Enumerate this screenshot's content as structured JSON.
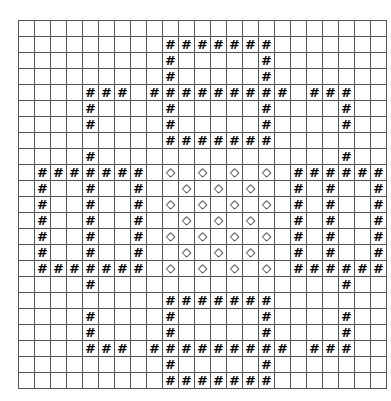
{
  "canvas": {
    "width": 391,
    "height": 401,
    "background": "#ffffff"
  },
  "grid": {
    "name": "pattern-grid",
    "columns": 23,
    "rows": 23,
    "cell_size": 15,
    "origin_x": 18,
    "origin_y": 20,
    "line_color": "#555555",
    "fill_color": "#000000",
    "text_color": "#000000",
    "glyphs": {
      "empty": "",
      "black": "",
      "hash": "#",
      "diamond": "◇"
    },
    "legend": [
      {
        "key": "black",
        "label": "filled-cell",
        "color": "#000000"
      },
      {
        "key": "hash",
        "label": "hash-cell",
        "glyph": "#"
      },
      {
        "key": "diamond",
        "label": "diamond-cell",
        "glyph": "◇"
      },
      {
        "key": "empty",
        "label": "empty-cell",
        "color": "#ffffff"
      }
    ],
    "cells": [
      "00000000000000000000000",
      "0BBBBBBB0HHHHHHH0BBBBBB",
      "0B00000B0H00000H0B0000B",
      "0B00000B0H00000H0B0000B",
      "0B00HHHB0HHHHHHH0BHHH0B",
      "0B00H00B0H00000H0B00H0B",
      "0B00H00B0H00000H0B00H0B",
      "0BBBBBBB0HHHHHHH0BBBBBB",
      "0000H0000000000000000H0",
      "0HHHHHHH0D0D0D0D0HHHHHH",
      "0H00H00H00D0D0D000H00H0",
      "0H00H00H0D0D0D0D0H00H0H",
      "0H00H00H00D0D0D000H00H0",
      "0H00H00H0D0D0D0D0H00H0H",
      "0H00H00H00D0D0D000H00H0",
      "0HHHHHHH0D0D0D0D0HHHHHH",
      "0000H0000000000000000H0",
      "0BBBBBBB0HHHHHHH0BBBBBB",
      "0B00H00B0H00000H0B00H0B",
      "0B00H00B0H00000H0B00H0B",
      "0B00HHHB0HHHHHHH0BHHH0B",
      "0B00000B0H00000H0B0000B",
      "0BBBBBBB0HHHHHHH0BBBBBB"
    ],
    "cells_note": "Row strings: 0=empty, B=black, H=hash, D=diamond. Corrected per-row detail supplied in rows_detail."
  },
  "rows_detail": [
    {
      "index": 0,
      "codes": "0,0,0,0,0,0,0,0,0,0,0,0,0,0,0,0,0,0,0,0,0,0,0"
    },
    {
      "index": 1,
      "codes": "0,B,B,B,B,B,B,B,0,H,H,H,H,H,H,H,0,B,B,B,B,B,B"
    },
    {
      "index": 2,
      "codes": "0,B,0,0,0,0,0,B,0,H,0,0,0,0,0,H,0,B,0,0,0,0,B"
    },
    {
      "index": 3,
      "codes": "0,B,0,0,0,0,0,B,0,H,0,0,0,0,0,H,0,B,0,0,0,0,B"
    },
    {
      "index": 4,
      "codes": "0,B,0,0,H,H,H,B,H,H,H,H,H,H,H,H,H,B,H,H,H,0,B"
    },
    {
      "index": 5,
      "codes": "0,B,0,0,H,0,0,B,0,H,0,0,0,0,0,H,0,B,0,0,H,0,B"
    },
    {
      "index": 6,
      "codes": "0,B,0,0,H,0,0,B,0,H,0,0,0,0,0,H,0,B,0,0,H,0,B"
    },
    {
      "index": 7,
      "codes": "0,B,B,B,B,B,B,B,0,H,H,H,H,H,H,H,0,B,B,B,B,B,B"
    },
    {
      "index": 8,
      "codes": "0,0,0,0,H,0,0,0,0,0,0,0,0,0,0,0,0,0,0,0,H,0,0"
    },
    {
      "index": 9,
      "codes": "0,H,H,H,H,H,H,H,0,D,0,D,0,D,0,D,0,H,H,H,H,H,H"
    },
    {
      "index": 10,
      "codes": "0,H,0,0,H,0,0,H,0,0,D,0,D,0,D,0,0,H,0,H,0,0,H"
    },
    {
      "index": 11,
      "codes": "0,H,0,0,H,0,0,H,0,D,0,D,0,D,0,D,0,H,0,H,0,0,H"
    },
    {
      "index": 12,
      "codes": "0,H,0,0,H,0,0,H,0,0,D,0,D,0,D,0,0,H,0,H,0,0,H"
    },
    {
      "index": 13,
      "codes": "0,H,0,0,H,0,0,H,0,D,0,D,0,D,0,D,0,H,0,H,0,0,H"
    },
    {
      "index": 14,
      "codes": "0,H,0,0,H,0,0,H,0,0,D,0,D,0,D,0,0,H,0,H,0,0,H"
    },
    {
      "index": 15,
      "codes": "0,H,H,H,H,H,H,H,0,D,0,D,0,D,0,D,0,H,H,H,H,H,H"
    },
    {
      "index": 16,
      "codes": "0,0,0,0,H,0,0,0,0,0,0,0,0,0,0,0,0,0,0,0,H,0,0"
    },
    {
      "index": 17,
      "codes": "0,B,B,B,B,B,B,B,0,H,H,H,H,H,H,H,0,B,B,B,B,B,B"
    },
    {
      "index": 18,
      "codes": "0,B,0,0,H,0,0,B,0,H,0,0,0,0,0,H,0,B,0,0,H,0,B"
    },
    {
      "index": 19,
      "codes": "0,B,0,0,H,0,0,B,0,H,0,0,0,0,0,H,0,B,0,0,H,0,B"
    },
    {
      "index": 20,
      "codes": "0,B,0,0,H,H,H,B,H,H,H,H,H,H,H,H,H,B,H,H,H,0,B"
    },
    {
      "index": 21,
      "codes": "0,B,0,0,0,0,0,B,0,H,0,0,0,0,0,H,0,B,0,0,0,0,B"
    },
    {
      "index": 22,
      "codes": "0,B,B,B,B,B,B,B,0,H,H,H,H,H,H,H,0,B,B,B,B,B,B"
    }
  ]
}
